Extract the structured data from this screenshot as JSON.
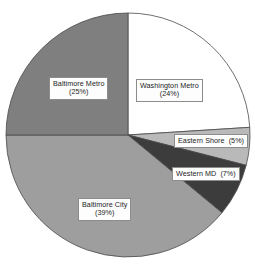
{
  "chart_data": {
    "type": "pie",
    "title": "",
    "xlabel": "",
    "ylabel": "",
    "legend": "none",
    "grid": false,
    "units": "percent",
    "start_angle_deg": 0,
    "direction": "clockwise",
    "categories": [
      "Washington Metro",
      "Eastern Shore",
      "Western MD",
      "Baltimore City",
      "Baltimore Metro"
    ],
    "values": [
      24,
      5,
      7,
      39,
      25
    ],
    "slices": [
      {
        "label": "Washington Metro",
        "value": 24,
        "value_text": "(24%)",
        "color": "#ffffff",
        "label_layout": "two-line"
      },
      {
        "label": "Eastern Shore",
        "value": 5,
        "value_text": "(5%)",
        "color": "#b9b9b9",
        "label_layout": "inline"
      },
      {
        "label": "Western MD",
        "value": 7,
        "value_text": "(7%)",
        "color": "#3c3c3c",
        "label_layout": "inline"
      },
      {
        "label": "Baltimore City",
        "value": 39,
        "value_text": "(39%)",
        "color": "#9e9e9e",
        "label_layout": "two-line"
      },
      {
        "label": "Baltimore Metro",
        "value": 25,
        "value_text": "(25%)",
        "color": "#7f7f7f",
        "label_layout": "two-line"
      }
    ],
    "geometry": {
      "center_x": 128,
      "center_y": 135,
      "radius": 122
    },
    "style": {
      "outline_color": "#4a4a4a",
      "label_box_background": "#fdfdfd",
      "label_box_border": "#8c8c8c",
      "label_text_color": "#1c1c1c",
      "background": "#ffffff"
    }
  }
}
